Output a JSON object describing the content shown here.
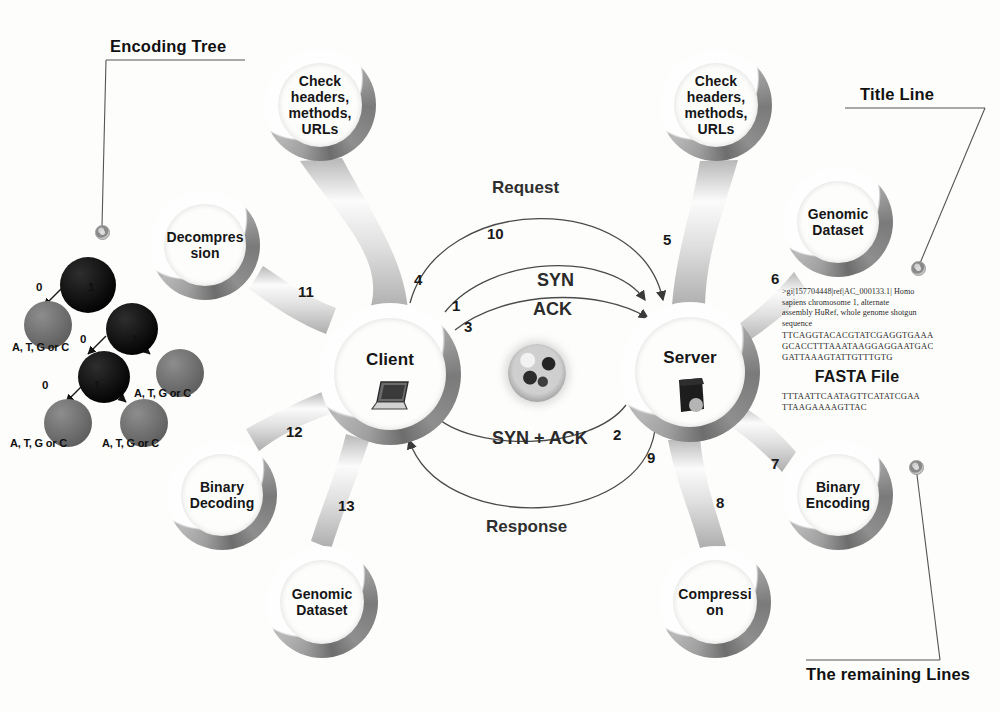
{
  "diagram": {
    "callouts": [
      {
        "id": "encoding-tree",
        "label": "Encoding Tree"
      },
      {
        "id": "title-line",
        "label": "Title Line"
      },
      {
        "id": "remaining-lines",
        "label": "The remaining Lines"
      }
    ],
    "nodes": [
      {
        "id": "check-headers-client",
        "label": "Check headers, methods, URLs",
        "lines": [
          "Check",
          "headers,",
          "methods,",
          "URLs"
        ],
        "cx": 320,
        "cy": 105,
        "r": 56,
        "ring": 14,
        "font": 14
      },
      {
        "id": "decompression",
        "label": "Decompression",
        "lines": [
          "Decompres",
          "sion"
        ],
        "cx": 205,
        "cy": 245,
        "r": 55,
        "ring": 14,
        "font": 14
      },
      {
        "id": "client",
        "label": "Client",
        "lines": [
          "Client"
        ],
        "cx": 390,
        "cy": 374,
        "r": 71,
        "ring": 15,
        "font": 17,
        "icon": "laptop-icon"
      },
      {
        "id": "binary-decoding",
        "label": "Binary Decoding",
        "lines": [
          "Binary",
          "Decoding"
        ],
        "cx": 222,
        "cy": 495,
        "r": 55,
        "ring": 14,
        "font": 14
      },
      {
        "id": "genomic-dataset-client",
        "label": "Genomic Dataset",
        "lines": [
          "Genomic",
          "Dataset"
        ],
        "cx": 322,
        "cy": 602,
        "r": 56,
        "ring": 14,
        "font": 14
      },
      {
        "id": "check-headers-server",
        "label": "Check headers, methods, URLs",
        "lines": [
          "Check",
          "headers,",
          "methods,",
          "URLs"
        ],
        "cx": 716,
        "cy": 105,
        "r": 56,
        "ring": 14,
        "font": 14
      },
      {
        "id": "genomic-dataset-server",
        "label": "Genomic Dataset",
        "lines": [
          "Genomic",
          "Dataset"
        ],
        "cx": 838,
        "cy": 222,
        "r": 55,
        "ring": 14,
        "font": 14
      },
      {
        "id": "server",
        "label": "Server",
        "lines": [
          "Server"
        ],
        "cx": 690,
        "cy": 372,
        "r": 70,
        "ring": 15,
        "font": 17,
        "icon": "server-rack-icon"
      },
      {
        "id": "binary-encoding",
        "label": "Binary Encoding",
        "lines": [
          "Binary",
          "Encoding"
        ],
        "cx": 838,
        "cy": 495,
        "r": 55,
        "ring": 14,
        "font": 14
      },
      {
        "id": "compression",
        "label": "Compression",
        "lines": [
          "Compressi",
          "on"
        ],
        "cx": 715,
        "cy": 602,
        "r": 56,
        "ring": 14,
        "font": 14
      }
    ],
    "spokes": [
      {
        "id": "client-check-headers",
        "number": "10",
        "nx": 487,
        "ny": 225
      },
      {
        "id": "client-decompression",
        "number": "11",
        "nx": 298,
        "ny": 283
      },
      {
        "id": "client-binary-decoding",
        "number": "12",
        "nx": 286,
        "ny": 423
      },
      {
        "id": "client-genomic-dataset",
        "number": "13",
        "nx": 338,
        "ny": 497
      },
      {
        "id": "server-check-headers",
        "number": "5",
        "nx": 663,
        "ny": 231
      },
      {
        "id": "server-genomic-dataset",
        "number": "6",
        "nx": 771,
        "ny": 270
      },
      {
        "id": "server-binary-encoding",
        "number": "7",
        "nx": 771,
        "ny": 455
      },
      {
        "id": "server-compression",
        "number": "8",
        "nx": 716,
        "ny": 494
      }
    ],
    "arc_numbers": [
      {
        "id": "arc-num-4",
        "value": "4",
        "nx": 414,
        "ny": 271
      },
      {
        "id": "arc-num-1",
        "value": "1",
        "nx": 452,
        "ny": 297
      },
      {
        "id": "arc-num-3",
        "value": "3",
        "nx": 464,
        "ny": 318
      },
      {
        "id": "arc-num-2",
        "value": "2",
        "nx": 613,
        "ny": 426
      },
      {
        "id": "arc-num-9",
        "value": "9",
        "nx": 647,
        "ny": 449
      }
    ],
    "protocol_labels": [
      {
        "id": "syn-label",
        "text": "SYN",
        "nx": 537,
        "ny": 270
      },
      {
        "id": "ack-label",
        "text": "ACK",
        "nx": 533,
        "ny": 299
      },
      {
        "id": "syn-ack-label",
        "text": "SYN + ACK",
        "nx": 492,
        "ny": 428
      }
    ],
    "arc_labels": [
      {
        "id": "request-label",
        "text": "Request",
        "nx": 492,
        "ny": 178
      },
      {
        "id": "response-label",
        "text": "Response",
        "nx": 486,
        "ny": 517
      }
    ],
    "fasta": {
      "header_lines": [
        ">gi|157704448|ref|AC_000133.1| Homo",
        "sapiens chromosome 1, alternate",
        "assembly HuRef, whole genome shotgun",
        "sequence"
      ],
      "sequence_lines_top": [
        "TTCAGGTACACGTATCGAGGTGAAA",
        "GCACCTTTAAATAAGGAGGAATGAC",
        "GATTAAAGTATTGTTTGTG"
      ],
      "title": "FASTA File",
      "sequence_lines_bottom": [
        "TTTAATTCAATAGTTCATATCGAA",
        "TTAAGAAAAGTTAC"
      ]
    },
    "encoding_tree": {
      "name": "Encoding Tree",
      "bits": [
        {
          "id": "bit-0-a",
          "value": "0",
          "nx": 20,
          "ny": 36
        },
        {
          "id": "bit-1-a",
          "value": "1",
          "nx": 72,
          "ny": 36
        },
        {
          "id": "bit-0-b",
          "value": "0",
          "nx": 64,
          "ny": 88
        },
        {
          "id": "bit-1-b",
          "value": "1",
          "nx": 116,
          "ny": 88
        },
        {
          "id": "bit-0-c",
          "value": "0",
          "nx": 26,
          "ny": 134
        },
        {
          "id": "bit-1-c",
          "value": "1",
          "nx": 78,
          "ny": 134
        }
      ],
      "leaf_label": "A, T, G or C",
      "leaf_labels": [
        {
          "id": "leaf-label-1",
          "nx": -4,
          "ny": 96
        },
        {
          "id": "leaf-label-2",
          "nx": 118,
          "ny": 142
        },
        {
          "id": "leaf-label-3",
          "nx": -6,
          "ny": 192
        },
        {
          "id": "leaf-label-4",
          "nx": 86,
          "ny": 192
        }
      ]
    },
    "colors": {
      "ring_dark": "#6d6d6d",
      "ring_light": "#b9b9b9",
      "background": "#fdfdfb",
      "text": "#111111",
      "tree_node_dark": "#050505",
      "tree_node_leaf": "#6e6e6e"
    }
  }
}
